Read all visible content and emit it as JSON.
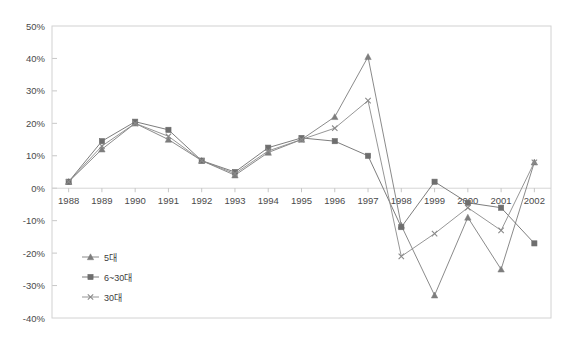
{
  "chart_data": {
    "type": "line",
    "title": "",
    "xlabel": "",
    "ylabel": "",
    "x": [
      "1988",
      "1989",
      "1990",
      "1991",
      "1992",
      "1993",
      "1994",
      "1995",
      "1996",
      "1997",
      "1998",
      "1999",
      "2000",
      "2001",
      "2002"
    ],
    "categories": [
      "1988",
      "1989",
      "1990",
      "1991",
      "1992",
      "1993",
      "1994",
      "1995",
      "1996",
      "1997",
      "1998",
      "1999",
      "2000",
      "2001",
      "2002"
    ],
    "ylim": [
      -40,
      50
    ],
    "ytick_labels": [
      "50%",
      "40%",
      "30%",
      "20%",
      "10%",
      "0%",
      "-10%",
      "-20%",
      "-30%",
      "-40%"
    ],
    "ytick_values": [
      50,
      40,
      30,
      20,
      10,
      0,
      -10,
      -20,
      -30,
      -40
    ],
    "grid": true,
    "legend_position": "inside-lower-left",
    "series": [
      {
        "name": "5대",
        "marker": "triangle",
        "color": "#7d7d7d",
        "values": [
          2,
          12,
          20,
          15,
          8.5,
          4,
          11,
          15,
          22,
          40.5,
          -11.5,
          -33,
          -9,
          -25,
          8
        ]
      },
      {
        "name": "6~30대",
        "marker": "square",
        "color": "#6e6e6e",
        "values": [
          2,
          14.5,
          20.5,
          18,
          8.5,
          5,
          12.5,
          15.5,
          14.5,
          10,
          -12,
          2,
          -4.5,
          -6,
          -17
        ]
      },
      {
        "name": "30대",
        "marker": "x",
        "color": "#8a8a8a",
        "values": [
          2,
          13,
          20,
          16,
          8.5,
          4.5,
          11.5,
          15,
          18.5,
          27,
          -21,
          -14,
          -6,
          -13,
          8
        ]
      }
    ]
  },
  "legend": {
    "items": [
      {
        "label": "5대"
      },
      {
        "label": "6~30대"
      },
      {
        "label": "30대"
      }
    ]
  },
  "colors": {
    "background": "#ffffff",
    "plot_border": "#d2d2d2",
    "gridline": "#dcdcdc",
    "text": "#4a4a4a"
  },
  "layout": {
    "plot_left": 52,
    "plot_right": 551,
    "plot_top": 26,
    "plot_bottom": 318,
    "zero_y": 183
  }
}
